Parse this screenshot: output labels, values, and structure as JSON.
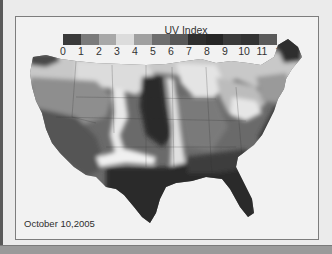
{
  "figure": {
    "legend": {
      "title": "UV Index",
      "ticks": [
        "0",
        "1",
        "2",
        "3",
        "4",
        "5",
        "6",
        "7",
        "8",
        "9",
        "10",
        "11",
        "12"
      ],
      "colors": [
        "#3a3a3a",
        "#7a7a7a",
        "#a8a8a8",
        "#dcdcdc",
        "#a0a0a0",
        "#6e6e6e",
        "#585858",
        "#2e2e2e",
        "#262626",
        "#3a3a3a",
        "#333333",
        "#444444"
      ]
    },
    "map": {
      "region": "Contiguous United States",
      "description": "Grayscale contour map of UV Index values"
    },
    "date_label": "October 10,2005"
  }
}
